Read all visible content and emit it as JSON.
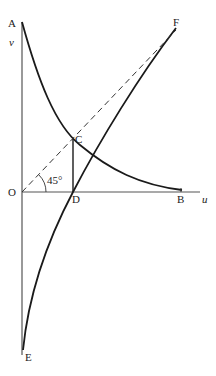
{
  "diagram": {
    "labels": {
      "A": "A",
      "v": "v",
      "F": "F",
      "C": "C",
      "O": "O",
      "D": "D",
      "B": "B",
      "u": "u",
      "E": "E",
      "angle": "45°"
    },
    "colors": {
      "curve": "#1a1a1a",
      "axis": "#555555",
      "dashed": "#333333"
    }
  }
}
